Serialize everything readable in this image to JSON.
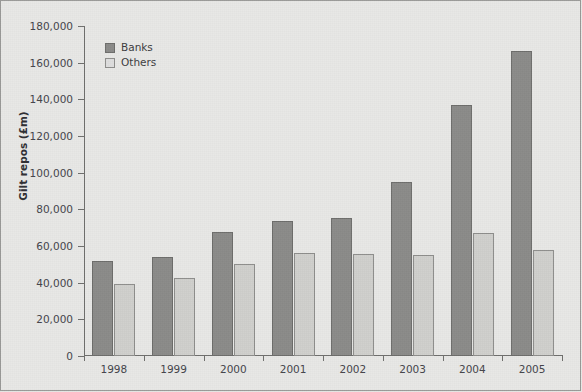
{
  "chart_data": {
    "type": "bar",
    "title": "",
    "xlabel": "",
    "ylabel": "Gilt repos (£m)",
    "categories": [
      "1998",
      "1999",
      "2000",
      "2001",
      "2002",
      "2003",
      "2004",
      "2005"
    ],
    "series": [
      {
        "name": "Banks",
        "color": "#8b8b89",
        "values": [
          52000,
          54000,
          67500,
          73500,
          75500,
          95000,
          137000,
          166500
        ]
      },
      {
        "name": "Others",
        "color": "#cfcfcc",
        "values": [
          39500,
          42500,
          50000,
          56000,
          55500,
          55000,
          67000,
          58000
        ]
      }
    ],
    "ylim": [
      0,
      180000
    ],
    "ytick_values": [
      0,
      20000,
      40000,
      60000,
      80000,
      100000,
      120000,
      140000,
      160000,
      180000
    ],
    "ytick_labels": [
      "0",
      "20,000",
      "40,000",
      "60,000",
      "80,000",
      "100,000",
      "120,000",
      "140,000",
      "160,000",
      "180,000"
    ],
    "grid": false,
    "legend_position": "top-left",
    "legend_entries": [
      "Banks",
      "Others"
    ]
  },
  "figure": {
    "background_color": "#e8e8e6",
    "border_color": "#9a9a98",
    "axis_color": "#6f6f6d"
  }
}
